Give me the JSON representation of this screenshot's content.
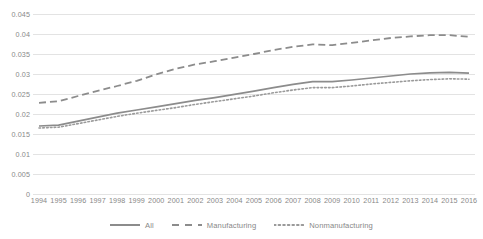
{
  "chart_data": {
    "type": "line",
    "title": "",
    "subtitle": "",
    "xlabel": "",
    "ylabel": "",
    "grid": true,
    "legend_position": "bottom",
    "xlim": [
      1994,
      2016
    ],
    "ylim": [
      0,
      0.045
    ],
    "ytick_labels": [
      "0.045",
      "0.04",
      "0.035",
      "0.03",
      "0.025",
      "0.02",
      "0.015",
      "0.01",
      "0.005",
      "0"
    ],
    "ytick_values": [
      0.045,
      0.04,
      0.035,
      0.03,
      0.025,
      0.02,
      0.015,
      0.01,
      0.005,
      0
    ],
    "categories": [
      1994,
      1995,
      1996,
      1997,
      1998,
      1999,
      2000,
      2001,
      2002,
      2003,
      2004,
      2005,
      2006,
      2007,
      2008,
      2009,
      2010,
      2011,
      2012,
      2013,
      2014,
      2015,
      2016
    ],
    "xtick_labels": [
      "1994",
      "1995",
      "1996",
      "1997",
      "1998",
      "1999",
      "2000",
      "2001",
      "2002",
      "2003",
      "2004",
      "2005",
      "2006",
      "2007",
      "2008",
      "2009",
      "2010",
      "2011",
      "2012",
      "2013",
      "2014",
      "2015",
      "2016"
    ],
    "series": [
      {
        "name": "All",
        "style": "solid",
        "color": "#8c8c8c",
        "values": [
          0.017,
          0.0172,
          0.0182,
          0.0192,
          0.0202,
          0.021,
          0.0218,
          0.0226,
          0.0234,
          0.0241,
          0.0249,
          0.0257,
          0.0266,
          0.0274,
          0.0281,
          0.0281,
          0.0285,
          0.029,
          0.0295,
          0.03,
          0.0303,
          0.0304,
          0.0302
        ]
      },
      {
        "name": "Manufacturing",
        "style": "dashed",
        "color": "#8c8c8c",
        "values": [
          0.0228,
          0.0232,
          0.0245,
          0.0258,
          0.027,
          0.0283,
          0.0299,
          0.0313,
          0.0324,
          0.0332,
          0.0341,
          0.035,
          0.036,
          0.0368,
          0.0374,
          0.0372,
          0.0378,
          0.0384,
          0.039,
          0.0394,
          0.0397,
          0.0397,
          0.0393
        ]
      },
      {
        "name": "Nonmanufacturing",
        "style": "dotted",
        "color": "#9a9a9a",
        "values": [
          0.0165,
          0.0167,
          0.0176,
          0.0185,
          0.0194,
          0.0202,
          0.0209,
          0.0216,
          0.0224,
          0.0231,
          0.0238,
          0.0245,
          0.0253,
          0.026,
          0.0266,
          0.0266,
          0.027,
          0.0275,
          0.0279,
          0.0283,
          0.0286,
          0.0288,
          0.0287
        ]
      }
    ]
  },
  "legend": {
    "items": [
      {
        "label": "All",
        "style": "solid"
      },
      {
        "label": "Manufacturing",
        "style": "dashed"
      },
      {
        "label": "Nonmanufacturing",
        "style": "dotted"
      }
    ]
  },
  "colors": {
    "gridline": "#e3e3e3",
    "tick_text": "#888888",
    "series_all": "#8c8c8c",
    "series_manufacturing": "#8c8c8c",
    "series_nonmanufacturing": "#9a9a9a",
    "background": "#ffffff"
  }
}
